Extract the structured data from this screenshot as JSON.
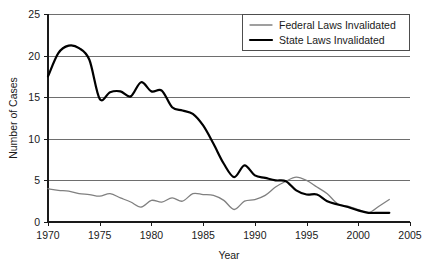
{
  "chart_data": {
    "type": "line",
    "title": "",
    "xlabel": "Year",
    "ylabel": "Number of Cases",
    "xlim": [
      1970,
      2005
    ],
    "ylim": [
      0,
      25
    ],
    "xticks": [
      1970,
      1975,
      1980,
      1985,
      1990,
      1995,
      2000,
      2005
    ],
    "xtick_labels": [
      "1970",
      "1975",
      "1980",
      "1985",
      "1990",
      "1995",
      "2000",
      "2005"
    ],
    "yticks": [
      0,
      5,
      10,
      15,
      20,
      25
    ],
    "ytick_labels": [
      "0",
      "5",
      "10",
      "15",
      "20",
      "25"
    ],
    "grid": "horizontal",
    "legend_position": "top-right",
    "series": [
      {
        "name": "Federal Laws Invalidated",
        "color": "#808080",
        "line_width": 1.3,
        "x": [
          1970,
          1971,
          1972,
          1973,
          1974,
          1975,
          1976,
          1977,
          1978,
          1979,
          1980,
          1981,
          1982,
          1983,
          1984,
          1985,
          1986,
          1987,
          1988,
          1989,
          1990,
          1991,
          1992,
          1993,
          1994,
          1995,
          1996,
          1997,
          1998,
          1999,
          2000,
          2001,
          2002,
          2003
        ],
        "values": [
          4.0,
          3.8,
          3.7,
          3.4,
          3.3,
          3.1,
          3.4,
          2.9,
          2.4,
          1.8,
          2.6,
          2.4,
          2.9,
          2.5,
          3.4,
          3.3,
          3.2,
          2.6,
          1.5,
          2.5,
          2.7,
          3.2,
          4.2,
          4.9,
          5.4,
          5.0,
          4.2,
          3.4,
          2.2,
          1.9,
          1.5,
          1.1,
          1.9,
          2.7
        ]
      },
      {
        "name": "State Laws Invalidated",
        "color": "#000000",
        "line_width": 2.2,
        "x": [
          1970,
          1971,
          1972,
          1973,
          1974,
          1975,
          1976,
          1977,
          1978,
          1979,
          1980,
          1981,
          1982,
          1983,
          1984,
          1985,
          1986,
          1987,
          1988,
          1989,
          1990,
          1991,
          1992,
          1993,
          1994,
          1995,
          1996,
          1997,
          1998,
          1999,
          2000,
          2001,
          2002,
          2003
        ],
        "values": [
          17.5,
          20.3,
          21.2,
          20.9,
          19.5,
          14.8,
          15.6,
          15.7,
          15.1,
          16.8,
          15.7,
          15.8,
          13.8,
          13.4,
          13.0,
          11.6,
          9.4,
          7.0,
          5.4,
          6.8,
          5.6,
          5.3,
          5.0,
          4.9,
          3.8,
          3.3,
          3.3,
          2.5,
          2.1,
          1.8,
          1.4,
          1.1,
          1.1,
          1.1
        ]
      }
    ]
  },
  "legend": {
    "items": [
      {
        "label": "Federal Laws Invalidated"
      },
      {
        "label": "State Laws Invalidated"
      }
    ]
  },
  "axes": {
    "y_title": "Number of Cases",
    "x_title": "Year"
  }
}
